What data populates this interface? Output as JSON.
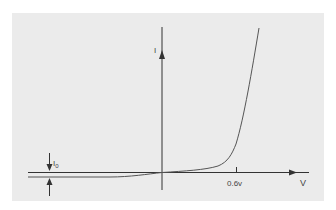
{
  "diagram": {
    "colors": {
      "background": "#ffffff",
      "panel": "#ebebeb",
      "axis": "#333333",
      "curve": "#555555",
      "text": "#444444"
    },
    "axes": {
      "y_label": "I",
      "x_label": "V"
    },
    "ticks": [
      {
        "label": "0.6v"
      }
    ],
    "annotations": {
      "reverse_saturation_current": "I",
      "reverse_saturation_subscript": "0"
    }
  }
}
